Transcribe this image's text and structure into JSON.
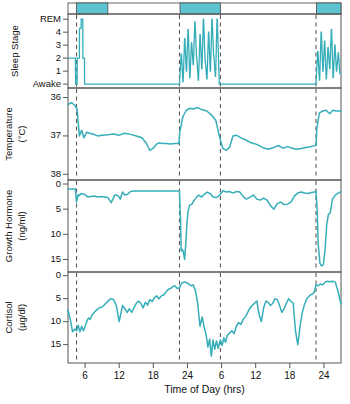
{
  "figure": {
    "x_axis_title": "Time of Day (hrs)",
    "x_ticks": [
      "6",
      "12",
      "18",
      "24",
      "6",
      "12",
      "18",
      "24"
    ],
    "x_tick_hours": [
      6,
      12,
      18,
      24,
      30,
      36,
      42,
      48
    ],
    "x_range_hours": [
      3,
      51
    ],
    "line_color": "#35aeba",
    "sleep_bar_color": "#5cc3d0",
    "axis_color": "#555555",
    "dashed_line_color": "#5a5a5a",
    "sleep_periods_hours": [
      [
        4.5,
        10.0
      ],
      [
        22.7,
        29.8
      ],
      [
        46.7,
        51.0
      ]
    ]
  },
  "panels": [
    {
      "id": "sleep-stage",
      "y_label": "Sleep Stage",
      "y_unit": "",
      "y_ticks": [
        "Awake",
        "1",
        "2",
        "3",
        "4",
        "REM"
      ],
      "y_tick_values": [
        0,
        1,
        2,
        3,
        4,
        5
      ]
    },
    {
      "id": "temperature",
      "y_label": "Temperature",
      "y_unit": "(°C)",
      "y_ticks": [
        "38",
        "37",
        "36"
      ],
      "y_tick_values": [
        38,
        37,
        36
      ]
    },
    {
      "id": "growth-hormone",
      "y_label": "Growth Hormone",
      "y_unit": "(ng/ml)",
      "y_ticks": [
        "15",
        "10",
        "5",
        "0"
      ],
      "y_tick_values": [
        15,
        10,
        5,
        0
      ]
    },
    {
      "id": "cortisol",
      "y_label": "Cortisol",
      "y_unit": "(µg/dl)",
      "y_ticks": [
        "15",
        "10",
        "5",
        "0"
      ],
      "y_tick_values": [
        15,
        10,
        5,
        0
      ]
    }
  ],
  "chart_data": {
    "type": "line",
    "title": "",
    "subtitle": "",
    "xlabel": "Time of Day (hrs)",
    "xlim": [
      3,
      51
    ],
    "grid": false,
    "legend": "none",
    "annotations": [
      {
        "label": "sleep-period-bar-1",
        "x_start": 4.5,
        "x_end": 10.0
      },
      {
        "label": "sleep-period-bar-2",
        "x_start": 22.7,
        "x_end": 29.8
      },
      {
        "label": "sleep-period-bar-3",
        "x_start": 46.7,
        "x_end": 51.0
      },
      {
        "label": "dashed-marker",
        "x": 4.5
      },
      {
        "label": "dashed-marker",
        "x": 22.6
      },
      {
        "label": "dashed-marker",
        "x": 29.8
      },
      {
        "label": "dashed-marker",
        "x": 46.6
      }
    ],
    "panels": [
      {
        "name": "Sleep Stage",
        "ylabel": "Sleep Stage",
        "ytick_labels": [
          "Awake",
          "1",
          "2",
          "3",
          "4",
          "REM"
        ],
        "ytick_values": [
          0,
          1,
          2,
          3,
          4,
          5
        ],
        "ylim": [
          5.4,
          -0.3
        ],
        "series": [
          {
            "name": "sleep stage",
            "x": [
              3.0,
              4.3,
              4.35,
              4.6,
              4.62,
              5.0,
              5.02,
              5.3,
              5.32,
              5.6,
              5.62,
              5.9,
              5.92,
              6.4,
              6.42,
              9.9,
              9.95,
              22.5,
              22.6,
              22.9,
              22.95,
              23.2,
              23.25,
              23.5,
              23.55,
              23.8,
              23.85,
              24.1,
              24.15,
              24.4,
              24.45,
              24.7,
              24.75,
              25.0,
              25.05,
              25.3,
              25.35,
              25.6,
              25.65,
              25.9,
              25.95,
              26.2,
              26.25,
              26.5,
              26.55,
              26.8,
              26.85,
              27.1,
              27.15,
              27.4,
              27.45,
              27.7,
              27.75,
              28.0,
              28.05,
              28.3,
              28.35,
              28.6,
              28.65,
              28.9,
              28.95,
              29.2,
              29.25,
              29.6,
              29.7,
              46.4,
              46.6,
              46.9,
              46.95,
              47.2,
              47.25,
              47.5,
              47.55,
              47.8,
              47.85,
              48.1,
              48.15,
              48.4,
              48.45,
              48.7,
              48.75,
              49.0,
              49.05,
              49.3,
              49.35,
              49.6,
              49.65,
              49.9,
              49.95,
              50.2,
              50.25,
              50.5,
              50.55,
              50.8,
              51.0
            ],
            "y": [
              2.0,
              2.0,
              0.0,
              0.0,
              2.0,
              2.0,
              4.3,
              4.3,
              5.0,
              5.0,
              2.0,
              2.0,
              0.0,
              0.0,
              0.0,
              0.0,
              0.0,
              0.0,
              0.0,
              2.3,
              2.3,
              0.2,
              0.2,
              3.5,
              3.5,
              1.0,
              1.0,
              4.2,
              4.2,
              0.5,
              0.5,
              3.2,
              3.2,
              1.5,
              1.5,
              4.8,
              4.8,
              2.0,
              2.0,
              0.3,
              0.3,
              3.8,
              3.8,
              1.2,
              1.2,
              5.0,
              5.0,
              1.8,
              1.8,
              0.4,
              0.4,
              4.0,
              4.0,
              1.0,
              1.0,
              5.0,
              5.0,
              2.2,
              2.2,
              0.6,
              0.6,
              5.0,
              5.0,
              0.0,
              0.0,
              0.0,
              0.0,
              2.5,
              2.5,
              0.3,
              0.3,
              4.0,
              4.0,
              1.0,
              1.0,
              3.3,
              3.3,
              0.4,
              0.4,
              2.8,
              2.8,
              1.2,
              1.2,
              4.2,
              4.2,
              0.5,
              0.5,
              3.0,
              3.0,
              1.0,
              1.0,
              2.4,
              2.4,
              0.8,
              0.8
            ]
          }
        ]
      },
      {
        "name": "Temperature",
        "ylabel": "Temperature (°C)",
        "ytick_labels": [
          "38",
          "37",
          "36"
        ],
        "ytick_values": [
          38,
          37,
          36
        ],
        "ylim": [
          35.75,
          38.15
        ],
        "series": [
          {
            "name": "core body temperature",
            "x": [
              3.0,
              3.6,
              4.2,
              4.6,
              5.0,
              5.4,
              5.8,
              6.3,
              6.8,
              7.4,
              8.2,
              9.0,
              10.0,
              11.0,
              12.0,
              13.0,
              14.0,
              15.0,
              16.0,
              16.8,
              17.4,
              18.0,
              18.5,
              19.0,
              19.6,
              20.3,
              21.0,
              21.8,
              22.5,
              22.65,
              23.2,
              23.8,
              24.4,
              25.0,
              25.8,
              26.6,
              27.4,
              28.2,
              29.0,
              29.6,
              30.2,
              30.8,
              31.4,
              32.0,
              32.6,
              33.4,
              34.2,
              35.2,
              36.2,
              37.2,
              38.2,
              39.2,
              40.0,
              40.8,
              41.6,
              42.4,
              43.2,
              44.0,
              44.8,
              45.6,
              46.2,
              46.6,
              46.75,
              47.2,
              47.8,
              48.4,
              49.0,
              49.6,
              50.2,
              51.0
            ],
            "y": [
              36.18,
              36.13,
              36.2,
              36.3,
              37.0,
              36.85,
              37.05,
              36.9,
              36.93,
              36.95,
              37.0,
              36.98,
              36.97,
              36.95,
              36.98,
              36.93,
              36.96,
              37.0,
              37.05,
              37.2,
              37.38,
              37.32,
              37.22,
              37.18,
              37.2,
              37.2,
              37.21,
              37.2,
              37.2,
              36.9,
              36.5,
              36.33,
              36.28,
              36.3,
              36.26,
              36.32,
              36.35,
              36.45,
              36.6,
              37.0,
              37.32,
              37.38,
              37.3,
              37.0,
              36.98,
              37.05,
              37.1,
              37.18,
              37.22,
              37.3,
              37.35,
              37.3,
              37.25,
              37.32,
              37.28,
              37.32,
              37.35,
              37.33,
              37.3,
              37.28,
              37.26,
              37.25,
              36.8,
              36.4,
              36.35,
              36.33,
              36.42,
              36.33,
              36.35,
              36.35
            ]
          }
        ]
      },
      {
        "name": "Growth Hormone",
        "ylabel": "Growth Hormone (ng/ml)",
        "ytick_labels": [
          "15",
          "10",
          "5",
          "0"
        ],
        "ytick_values": [
          15,
          10,
          5,
          0
        ],
        "ylim": [
          -0.8,
          17.5
        ],
        "series": [
          {
            "name": "growth hormone",
            "x": [
              3.0,
              4.3,
              4.5,
              4.8,
              5.0,
              5.3,
              5.6,
              6.0,
              6.5,
              7.0,
              7.6,
              8.2,
              8.8,
              9.4,
              10.0,
              10.6,
              11.2,
              11.8,
              12.2,
              12.6,
              13.0,
              13.4,
              14.0,
              14.6,
              15.2,
              15.8,
              16.4,
              17.0,
              17.6,
              18.2,
              19.0,
              20.0,
              21.0,
              22.0,
              22.5,
              22.6,
              22.8,
              22.9,
              23.1,
              23.3,
              23.5,
              23.7,
              23.9,
              24.1,
              24.4,
              24.8,
              25.2,
              25.6,
              26.0,
              26.5,
              27.0,
              27.5,
              28.0,
              28.5,
              29.0,
              29.4,
              29.8,
              30.3,
              30.8,
              31.4,
              32.0,
              32.6,
              33.2,
              33.8,
              34.4,
              35.0,
              35.6,
              36.2,
              36.8,
              37.4,
              38.0,
              38.6,
              39.2,
              39.8,
              40.4,
              41.0,
              41.6,
              42.2,
              42.8,
              43.4,
              44.0,
              44.6,
              45.2,
              45.8,
              46.3,
              46.6,
              46.8,
              47.0,
              47.3,
              47.6,
              47.9,
              48.2,
              48.5,
              48.8,
              49.1,
              49.5,
              50.0,
              50.5,
              51.0
            ],
            "y": [
              1.0,
              1.0,
              3.6,
              2.1,
              2.3,
              1.9,
              2.0,
              2.1,
              2.6,
              2.5,
              2.4,
              2.6,
              2.5,
              2.6,
              2.7,
              3.7,
              2.2,
              2.3,
              3.0,
              1.6,
              2.2,
              2.1,
              1.5,
              1.4,
              1.4,
              1.4,
              1.4,
              1.4,
              1.4,
              1.4,
              1.4,
              1.4,
              1.4,
              1.4,
              1.4,
              1.5,
              8.0,
              13.3,
              13.0,
              13.6,
              15.0,
              12.0,
              8.0,
              5.5,
              4.2,
              4.0,
              3.2,
              2.6,
              2.2,
              2.6,
              2.0,
              1.6,
              1.9,
              2.6,
              2.7,
              2.5,
              2.0,
              1.3,
              1.6,
              1.5,
              1.8,
              1.5,
              1.6,
              2.5,
              3.0,
              2.6,
              2.2,
              3.0,
              3.2,
              2.8,
              3.2,
              4.3,
              5.0,
              3.9,
              3.6,
              4.1,
              4.0,
              3.6,
              2.4,
              1.8,
              1.6,
              1.8,
              1.9,
              1.7,
              1.6,
              1.5,
              5.0,
              12.0,
              15.8,
              16.3,
              16.0,
              13.0,
              8.0,
              6.0,
              5.8,
              3.0,
              2.2,
              1.8,
              1.5
            ]
          }
        ]
      },
      {
        "name": "Cortisol",
        "ylabel": "Cortisol (µg/dl)",
        "ytick_labels": [
          "15",
          "10",
          "5",
          "0"
        ],
        "ytick_values": [
          15,
          10,
          5,
          0
        ],
        "ylim": [
          -0.8,
          19.0
        ],
        "series": [
          {
            "name": "cortisol",
            "x": [
              3.0,
              3.4,
              3.8,
              4.2,
              4.5,
              4.8,
              5.1,
              5.4,
              5.7,
              6.0,
              6.3,
              6.6,
              6.9,
              7.2,
              7.6,
              8.0,
              8.5,
              9.0,
              9.5,
              10.0,
              10.5,
              11.0,
              11.5,
              12.0,
              12.3,
              12.6,
              13.0,
              13.4,
              13.8,
              14.2,
              14.6,
              15.0,
              15.4,
              15.8,
              16.2,
              16.6,
              17.0,
              17.4,
              17.8,
              18.2,
              18.6,
              19.0,
              19.4,
              19.8,
              20.2,
              20.6,
              21.0,
              21.4,
              21.8,
              22.2,
              22.6,
              23.0,
              23.4,
              23.8,
              24.2,
              24.6,
              25.0,
              25.4,
              25.8,
              26.2,
              26.6,
              27.0,
              27.3,
              27.6,
              27.9,
              28.2,
              28.5,
              28.8,
              29.1,
              29.4,
              29.8,
              30.1,
              30.4,
              30.7,
              31.0,
              31.4,
              31.8,
              32.2,
              32.6,
              33.0,
              33.4,
              33.8,
              34.2,
              34.6,
              35.0,
              35.4,
              35.8,
              36.2,
              36.6,
              37.0,
              37.4,
              37.8,
              38.2,
              38.6,
              39.0,
              39.4,
              39.8,
              40.2,
              40.6,
              41.0,
              41.4,
              41.8,
              42.2,
              42.6,
              43.0,
              43.4,
              43.8,
              44.2,
              44.6,
              45.0,
              45.3,
              45.6,
              46.0,
              46.3,
              46.6,
              47.0,
              47.4,
              47.8,
              48.2,
              48.6,
              49.0,
              49.5,
              50.0,
              50.5,
              51.0
            ],
            "y": [
              7.5,
              9.5,
              12.2,
              11.6,
              12.0,
              10.8,
              12.2,
              11.0,
              12.0,
              11.0,
              10.0,
              9.2,
              9.5,
              8.6,
              8.0,
              7.5,
              7.0,
              6.8,
              6.2,
              5.6,
              5.0,
              5.2,
              6.5,
              10.0,
              8.2,
              6.5,
              7.2,
              8.0,
              7.2,
              8.0,
              7.0,
              6.0,
              5.5,
              6.0,
              7.0,
              5.8,
              6.4,
              5.2,
              5.6,
              4.8,
              4.4,
              5.0,
              4.4,
              4.2,
              3.6,
              3.0,
              2.8,
              2.4,
              2.2,
              2.8,
              2.6,
              1.6,
              1.4,
              1.5,
              1.8,
              2.2,
              2.0,
              3.2,
              6.0,
              11.0,
              9.0,
              11.5,
              13.0,
              15.5,
              13.8,
              17.5,
              14.0,
              16.0,
              14.2,
              15.8,
              14.0,
              15.2,
              13.5,
              14.5,
              13.0,
              12.5,
              12.0,
              12.6,
              11.0,
              10.2,
              10.6,
              9.5,
              9.0,
              8.0,
              7.0,
              6.5,
              6.0,
              5.5,
              8.5,
              10.0,
              7.0,
              5.5,
              5.8,
              6.5,
              6.0,
              5.0,
              5.2,
              6.5,
              8.0,
              7.2,
              6.0,
              5.0,
              5.6,
              6.0,
              12.0,
              15.0,
              11.0,
              8.0,
              6.2,
              5.0,
              4.6,
              4.2,
              4.0,
              3.6,
              2.0,
              2.2,
              1.8,
              2.0,
              1.4,
              1.2,
              1.3,
              1.2,
              1.4,
              3.5,
              6.2
            ]
          }
        ]
      }
    ]
  }
}
